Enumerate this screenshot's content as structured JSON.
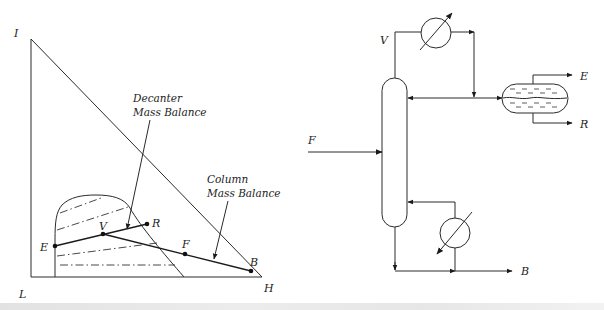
{
  "ternary_diagram": {
    "vertices": {
      "top": {
        "label": "I"
      },
      "bottom_left": {
        "label": "L"
      },
      "bottom_right": {
        "label": "H"
      }
    },
    "points": [
      {
        "label": "E"
      },
      {
        "label": "V"
      },
      {
        "label": "R"
      },
      {
        "label": "F"
      },
      {
        "label": "B"
      }
    ],
    "annotations": {
      "decanter": {
        "line1": "Decanter",
        "line2": "Mass Balance"
      },
      "column": {
        "line1": "Column",
        "line2": "Mass Balance"
      }
    },
    "tie_line_count": 4
  },
  "flowsheet": {
    "streams": {
      "feed": "F",
      "vapor": "V",
      "extract": "E",
      "raffinate": "R",
      "bottoms": "B"
    },
    "units": [
      "distillation-column",
      "condenser",
      "decanter",
      "reboiler"
    ]
  },
  "colors": {
    "line": "#2a2a2a",
    "background": "#ffffff"
  }
}
